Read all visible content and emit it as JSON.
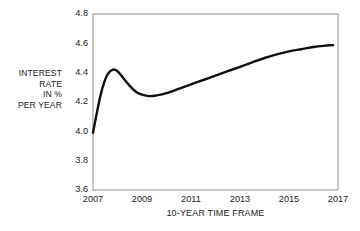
{
  "chart_data": {
    "type": "line",
    "title": "",
    "subtitle": "",
    "xlabel": "10-YEAR TIME FRAME",
    "ylabel": "INTEREST RATE IN % PER YEAR",
    "ylabel_lines": [
      "INTEREST",
      "RATE",
      "IN %",
      "PER YEAR"
    ],
    "xlim": [
      2007,
      2017
    ],
    "ylim": [
      3.6,
      4.8
    ],
    "xticks": [
      2007,
      2009,
      2011,
      2013,
      2015,
      2017
    ],
    "xtick_labels": [
      "2007",
      "2009",
      "2011",
      "2013",
      "2015",
      "2017"
    ],
    "yticks": [
      3.6,
      3.8,
      4.0,
      4.2,
      4.4,
      4.6,
      4.8
    ],
    "ytick_labels": [
      "3.6",
      "3.8",
      "4.0",
      "4.2",
      "4.4",
      "4.6",
      "4.8"
    ],
    "grid": false,
    "legend": false,
    "legend_position": "none",
    "frame": true,
    "series": [
      {
        "name": "Interest rate",
        "color": "#111111",
        "x": [
          2007.0,
          2007.15,
          2007.3,
          2007.45,
          2007.6,
          2007.8,
          2008.0,
          2008.25,
          2008.5,
          2008.75,
          2009.0,
          2009.3,
          2009.6,
          2010.0,
          2010.5,
          2011.0,
          2011.5,
          2012.0,
          2012.5,
          2013.0,
          2013.5,
          2014.0,
          2014.5,
          2015.0,
          2015.5,
          2016.0,
          2016.4,
          2016.8
        ],
        "values": [
          3.99,
          4.12,
          4.24,
          4.33,
          4.39,
          4.42,
          4.41,
          4.36,
          4.31,
          4.27,
          4.25,
          4.24,
          4.245,
          4.26,
          4.29,
          4.32,
          4.35,
          4.38,
          4.41,
          4.44,
          4.47,
          4.5,
          4.525,
          4.545,
          4.56,
          4.575,
          4.583,
          4.588
        ]
      }
    ],
    "annotations": []
  },
  "axes": {
    "y_caption": "INTEREST RATE IN % PER YEAR",
    "x_caption": "10-YEAR TIME FRAME"
  },
  "colors": {
    "line": "#111111",
    "frame": "#8c8c8c",
    "text": "#1a1a1a",
    "background": "#ffffff"
  }
}
